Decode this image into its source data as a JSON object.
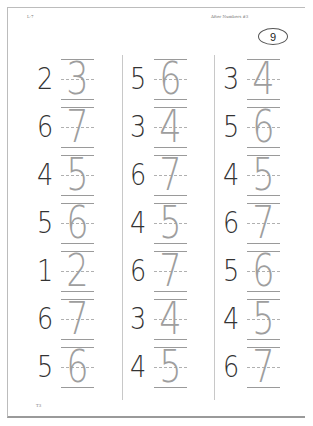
{
  "header": {
    "left_label": "L-7",
    "right_label": "After Numbers #3",
    "page_number": "9"
  },
  "footer": {
    "label": "T3"
  },
  "columns": [
    {
      "rows": [
        {
          "given": "2",
          "trace": "3"
        },
        {
          "given": "6",
          "trace": "7"
        },
        {
          "given": "4",
          "trace": "5"
        },
        {
          "given": "5",
          "trace": "6"
        },
        {
          "given": "1",
          "trace": "2"
        },
        {
          "given": "6",
          "trace": "7"
        },
        {
          "given": "5",
          "trace": "6"
        }
      ]
    },
    {
      "rows": [
        {
          "given": "5",
          "trace": "6"
        },
        {
          "given": "3",
          "trace": "4"
        },
        {
          "given": "6",
          "trace": "7"
        },
        {
          "given": "4",
          "trace": "5"
        },
        {
          "given": "6",
          "trace": "7"
        },
        {
          "given": "3",
          "trace": "4"
        },
        {
          "given": "4",
          "trace": "5"
        }
      ]
    },
    {
      "rows": [
        {
          "given": "3",
          "trace": "4"
        },
        {
          "given": "5",
          "trace": "6"
        },
        {
          "given": "4",
          "trace": "5"
        },
        {
          "given": "6",
          "trace": "7"
        },
        {
          "given": "5",
          "trace": "6"
        },
        {
          "given": "4",
          "trace": "5"
        },
        {
          "given": "6",
          "trace": "7"
        }
      ]
    }
  ]
}
